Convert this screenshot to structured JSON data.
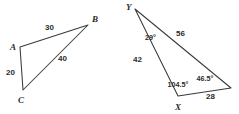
{
  "figure": {
    "background_color": "#ffffff",
    "stroke_color": "#3a3a3a",
    "text_color": "#2b2b2b",
    "degree_symbol": "°",
    "triangles": [
      {
        "id": "triangle-abc",
        "name": "Triangle ABC",
        "vertices": [
          {
            "label": "A",
            "x": 20,
            "y": 47,
            "label_x": 10,
            "label_y": 50
          },
          {
            "label": "B",
            "x": 88,
            "y": 25,
            "label_x": 92,
            "label_y": 22
          },
          {
            "label": "C",
            "x": 23,
            "y": 90,
            "label_x": 18,
            "label_y": 103
          }
        ],
        "path": "M 20 47 L 88 25 L 23 90 Z",
        "sides": [
          {
            "name": "AB",
            "length": "30",
            "label_x": 45,
            "label_y": 30
          },
          {
            "name": "AC",
            "length": "20",
            "label_x": 6,
            "label_y": 75
          },
          {
            "name": "CB",
            "length": "40",
            "label_x": 58,
            "label_y": 61
          }
        ],
        "angles": []
      },
      {
        "id": "triangle-xyz",
        "name": "Triangle with vertices Y and X",
        "vertices": [
          {
            "label": "Y",
            "x": 135,
            "y": 9,
            "label_x": 126,
            "label_y": 10
          },
          {
            "label": "X",
            "x": 178,
            "y": 96,
            "label_x": 175,
            "label_y": 110
          },
          {
            "label": "",
            "x": 231,
            "y": 88,
            "label_x": 0,
            "label_y": 0
          }
        ],
        "path": "M 135 9 L 231 88 L 178 96 Z",
        "sides": [
          {
            "name": "YR",
            "length": "56",
            "label_x": 176,
            "label_y": 36
          },
          {
            "name": "YX",
            "length": "42",
            "label_x": 133,
            "label_y": 62
          },
          {
            "name": "XR",
            "length": "28",
            "label_x": 206,
            "label_y": 99
          }
        ],
        "angles": [
          {
            "at": "Y",
            "value": "29",
            "label_x": 145,
            "label_y": 40
          },
          {
            "at": "X",
            "value": "104.5",
            "label_x": 178,
            "label_y": 87
          },
          {
            "at": "R",
            "value": "46.5",
            "label_x": 205,
            "label_y": 81
          }
        ]
      }
    ]
  }
}
